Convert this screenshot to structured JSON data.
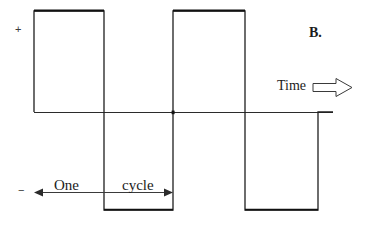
{
  "figure": {
    "panel_label": "B.",
    "axis_positive_label": "+",
    "axis_negative_label": "−",
    "time_axis_label": "Time",
    "cycle_label_part1": "One",
    "cycle_label_part2": "cycle",
    "stroke_color": "#1a1a1a",
    "background_color": "#ffffff"
  },
  "chart_data": {
    "type": "line",
    "title": "B.",
    "xlabel": "Time",
    "ylabel": "",
    "grid": false,
    "legend": null,
    "annotations": [
      {
        "text": "+",
        "role": "positive-axis-marker"
      },
      {
        "text": "−",
        "role": "negative-axis-marker"
      },
      {
        "text": "One cycle",
        "role": "period-span-label"
      },
      {
        "text": "Time",
        "role": "axis-direction-label"
      },
      {
        "text": "B.",
        "role": "panel-identifier"
      }
    ],
    "waveform": "square",
    "amplitude": 1,
    "baseline": 0,
    "period_px": 139,
    "cycles_shown": 2,
    "xlim": [
      34,
      333
    ],
    "ylim": [
      -1,
      1
    ],
    "x": [
      34,
      34,
      104,
      104,
      173,
      173,
      245,
      245,
      318,
      318,
      333
    ],
    "y": [
      0,
      1,
      1,
      -1,
      -1,
      1,
      1,
      -1,
      -1,
      0,
      0
    ],
    "series": [
      {
        "name": "square wave",
        "points": [
          {
            "x": 34,
            "y": 0
          },
          {
            "x": 34,
            "y": 1
          },
          {
            "x": 104,
            "y": 1
          },
          {
            "x": 104,
            "y": -1
          },
          {
            "x": 173,
            "y": -1
          },
          {
            "x": 173,
            "y": 1
          },
          {
            "x": 245,
            "y": 1
          },
          {
            "x": 245,
            "y": -1
          },
          {
            "x": 318,
            "y": -1
          },
          {
            "x": 318,
            "y": 0
          },
          {
            "x": 333,
            "y": 0
          }
        ]
      }
    ],
    "period_marker": {
      "from_x": 34,
      "to_x": 173,
      "label": "One cycle"
    }
  }
}
